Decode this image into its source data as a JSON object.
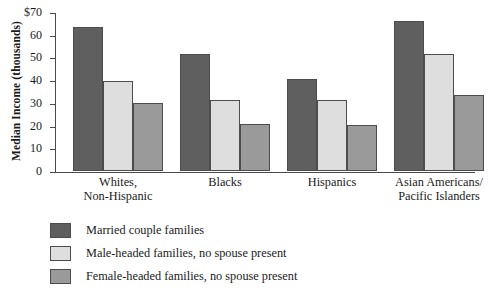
{
  "chart_data": {
    "type": "bar",
    "title": "",
    "subtitle": "",
    "xlabel": "",
    "ylabel": "Median Income (thousands)",
    "ylim": [
      0,
      70
    ],
    "y_ticks": [
      "$70",
      "60",
      "50",
      "40",
      "30",
      "20",
      "10",
      "0"
    ],
    "y_tick_values": [
      70,
      60,
      50,
      40,
      30,
      20,
      10,
      0
    ],
    "grid": false,
    "legend_position": "below-left",
    "categories": [
      "Whites,\nNon-Hispanic",
      "Blacks",
      "Hispanics",
      "Asian Americans/\nPacific Islanders"
    ],
    "series": [
      {
        "name": "Married couple families",
        "color": "#5f5f5f",
        "values": [
          63.5,
          51.5,
          40.3,
          66.0
        ]
      },
      {
        "name": "Male-headed families, no spouse present",
        "color": "#dedede",
        "values": [
          39.7,
          31.2,
          31.2,
          51.5
        ]
      },
      {
        "name": "Female-headed families, no spouse present",
        "color": "#9a9a9a",
        "values": [
          29.8,
          20.6,
          20.2,
          33.4
        ]
      }
    ]
  },
  "colors": {
    "axis": "#4a4a4a",
    "bar_border": "#4c4c4c",
    "text": "#1a1a1a",
    "background": "#ffffff"
  }
}
